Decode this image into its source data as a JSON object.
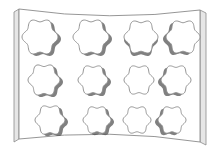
{
  "figure": {
    "rows": 3,
    "columns": 4,
    "hole_shape": "six-lobed flower",
    "colors": {
      "background": "#ffffff",
      "panel_face": "#ffffff",
      "panel_edge": "#e6e6e6",
      "outline": "#8a8a8a",
      "hole_shadow": "#555555"
    },
    "holes": [
      {
        "row": 1,
        "col": 1,
        "cx": 40,
        "cy": 37,
        "r": 18,
        "shadow": "right"
      },
      {
        "row": 1,
        "col": 2,
        "cx": 91,
        "cy": 37,
        "r": 18,
        "shadow": "right"
      },
      {
        "row": 1,
        "col": 3,
        "cx": 141,
        "cy": 37,
        "r": 17,
        "shadow": "bottom"
      },
      {
        "row": 1,
        "col": 4,
        "cx": 183,
        "cy": 37,
        "r": 17,
        "shadow": "left"
      },
      {
        "row": 2,
        "col": 1,
        "cx": 44,
        "cy": 80,
        "r": 16,
        "shadow": "right"
      },
      {
        "row": 2,
        "col": 2,
        "cx": 93,
        "cy": 80,
        "r": 15,
        "shadow": "right"
      },
      {
        "row": 2,
        "col": 3,
        "cx": 139,
        "cy": 80,
        "r": 15,
        "shadow": "none"
      },
      {
        "row": 2,
        "col": 4,
        "cx": 176,
        "cy": 80,
        "r": 15,
        "shadow": "left"
      },
      {
        "row": 3,
        "col": 1,
        "cx": 50,
        "cy": 120,
        "r": 15,
        "shadow": "right"
      },
      {
        "row": 3,
        "col": 2,
        "cx": 97,
        "cy": 120,
        "r": 14,
        "shadow": "right"
      },
      {
        "row": 3,
        "col": 3,
        "cx": 137,
        "cy": 120,
        "r": 14,
        "shadow": "none"
      },
      {
        "row": 3,
        "col": 4,
        "cx": 172,
        "cy": 120,
        "r": 14,
        "shadow": "left"
      }
    ]
  }
}
